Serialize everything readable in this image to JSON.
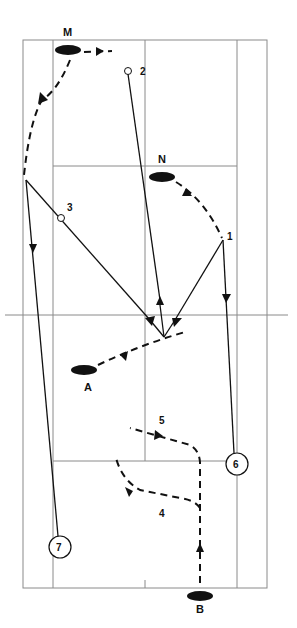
{
  "diagram": {
    "type": "badminton-court-play-diagram",
    "colors": {
      "line": "#111111",
      "court": "#8a8a8a",
      "background": "#ffffff"
    },
    "players": [
      {
        "id": "M",
        "label": "M"
      },
      {
        "id": "N",
        "label": "N"
      },
      {
        "id": "A",
        "label": "A"
      },
      {
        "id": "B",
        "label": "B"
      }
    ],
    "shot_markers": [
      {
        "id": "1",
        "label": "1",
        "style": "plain"
      },
      {
        "id": "2",
        "label": "2",
        "style": "open-dot"
      },
      {
        "id": "3",
        "label": "3",
        "style": "open-dot"
      },
      {
        "id": "4",
        "label": "4",
        "style": "plain"
      },
      {
        "id": "5",
        "label": "5",
        "style": "plain"
      },
      {
        "id": "6",
        "label": "6",
        "style": "circled"
      },
      {
        "id": "7",
        "label": "7",
        "style": "circled"
      }
    ]
  }
}
